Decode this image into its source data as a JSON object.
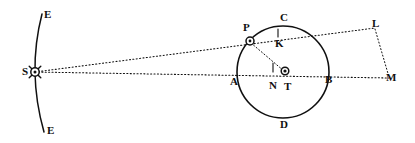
{
  "figure": {
    "width": 415,
    "height": 143,
    "background_color": "#ffffff",
    "ink_color": "#101010"
  },
  "labels": {
    "arc_top": "E",
    "arc_bottom": "E",
    "sun": "S",
    "planet": "P",
    "orbit_top": "C",
    "orbit_bottom": "D",
    "orbit_left": "A",
    "orbit_right": "B",
    "foot_upper": "K",
    "foot_lower": "N",
    "center": "T",
    "vertex_upper_right": "L",
    "vertex_lower_right": "M"
  },
  "points": {
    "arc_top": {
      "label_x": 44,
      "label_y": 9,
      "x": 42,
      "y": 14
    },
    "arc_bottom": {
      "label_x": 47,
      "label_y": 125,
      "x": 44,
      "y": 132
    },
    "sun": {
      "label_x": 22,
      "label_y": 66,
      "x": 35,
      "y": 72
    },
    "planet": {
      "label_x": 243,
      "label_y": 22,
      "x": 250,
      "y": 41
    },
    "orbit_top": {
      "label_x": 280,
      "label_y": 12,
      "x": 283,
      "y": 26
    },
    "orbit_bottom": {
      "label_x": 280,
      "label_y": 119,
      "x": 283,
      "y": 117
    },
    "orbit_left": {
      "label_x": 230,
      "label_y": 76,
      "x": 237,
      "y": 72
    },
    "orbit_right": {
      "label_x": 325,
      "label_y": 74,
      "x": 329,
      "y": 72
    },
    "foot_upper": {
      "label_x": 275,
      "label_y": 38,
      "x": 278,
      "y": 36
    },
    "foot_lower": {
      "label_x": 269,
      "label_y": 80,
      "x": 273,
      "y": 72
    },
    "center": {
      "label_x": 284,
      "label_y": 81,
      "x": 285,
      "y": 72
    },
    "vertex_upper_right": {
      "label_x": 372,
      "label_y": 18,
      "x": 375,
      "y": 28
    },
    "vertex_lower_right": {
      "label_x": 386,
      "label_y": 72,
      "x": 389,
      "y": 78
    }
  },
  "geometry": {
    "orbit_circle": {
      "cx": 283,
      "cy": 72,
      "r": 46
    },
    "sun_arc": {
      "x1": 42,
      "y1": 14,
      "cx": 27,
      "cy": 72,
      "x2": 44,
      "y2": 132
    },
    "sun_marker_r": 4.2,
    "planet_marker_r": 4.0,
    "center_marker_r": 3.8
  },
  "lines": [
    {
      "name": "sun-to-m-horizontal",
      "from": "sun",
      "to": "vertex_lower_right",
      "style": "dotted"
    },
    {
      "name": "sun-to-l-through-planet",
      "from": "sun",
      "to": "vertex_upper_right",
      "style": "dotted"
    },
    {
      "name": "planet-to-center",
      "from": "planet",
      "to": "center",
      "style": "dotted"
    },
    {
      "name": "l-to-m",
      "from": "vertex_upper_right",
      "to": "vertex_lower_right",
      "style": "dotted"
    }
  ],
  "tick_marks": [
    {
      "name": "tick-at-k",
      "x": 278,
      "y_top": 29,
      "y_bottom": 36
    },
    {
      "name": "tick-at-n",
      "x": 273,
      "y_top": 64,
      "y_bottom": 72
    }
  ]
}
